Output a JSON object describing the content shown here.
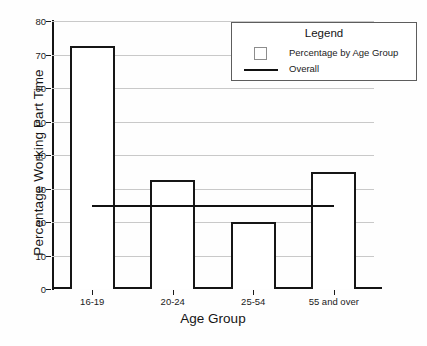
{
  "chart_data": {
    "type": "bar",
    "title": "",
    "xlabel": "Age Group",
    "ylabel": "Percentage Working Part Time",
    "categories": [
      "16-19",
      "20-24",
      "25-54",
      "55 and over"
    ],
    "values": [
      72,
      32,
      19.5,
      34.3
    ],
    "ylim": [
      0,
      80
    ],
    "yticks": [
      0,
      10,
      20,
      30,
      40,
      50,
      60,
      70,
      80
    ],
    "ytick_labels": [
      "0",
      "10",
      "20",
      "30",
      "40",
      "50",
      "60",
      "70",
      "80"
    ],
    "grid": true,
    "series": [
      {
        "name": "Percentage by Age Group",
        "type": "bar",
        "values": [
          72,
          32,
          19.5,
          34.3
        ]
      },
      {
        "name": "Overall",
        "type": "line",
        "value": 25,
        "constant": true
      }
    ],
    "legend": {
      "position": "top-right",
      "title": "Legend",
      "entries": [
        {
          "label": "Percentage by Age Group",
          "marker": "open-square-swatch"
        },
        {
          "label": "Overall",
          "marker": "solid-line-swatch"
        }
      ]
    },
    "colors": {
      "bar_fill": "#ffffff",
      "bar_edge": "#161616",
      "overall_line": "#111111",
      "gridline": "#c9c9c9",
      "axis": "#141414",
      "background": "#fefefe"
    }
  }
}
